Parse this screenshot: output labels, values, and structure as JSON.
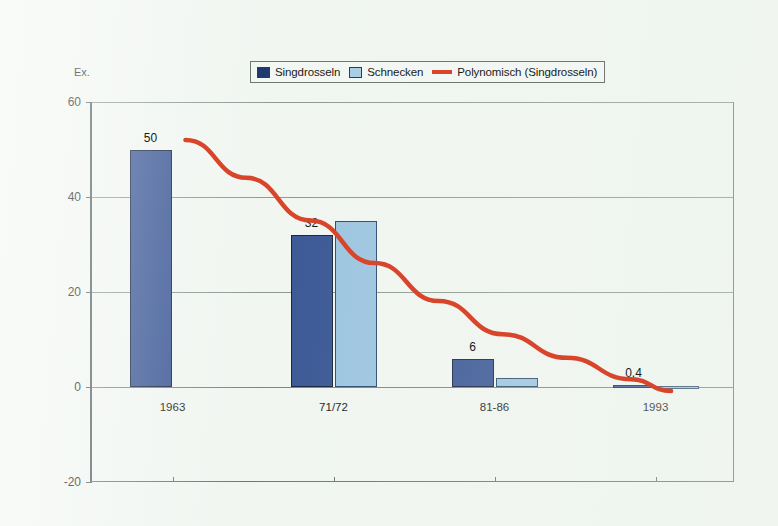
{
  "chart_data": {
    "type": "bar",
    "title": "",
    "subtitle": "",
    "xlabel": "",
    "ylabel": "Ex.",
    "categories": [
      "1963",
      "71/72",
      "81-86",
      "1993"
    ],
    "series": [
      {
        "name": "Singdrosseln",
        "color": "#3a5795",
        "values": [
          50,
          32,
          6,
          0.4
        ]
      },
      {
        "name": "Schnecken",
        "color": "#9cc5e0",
        "values": [
          0,
          35,
          2,
          0.3
        ]
      }
    ],
    "data_labels": [
      "50",
      "32",
      "6",
      "0,4"
    ],
    "trendline": {
      "name": "Polynomisch (Singdrosseln)",
      "color": "#d9452a",
      "type": "polynomial",
      "points": [
        {
          "x": 0.22,
          "y": 52
        },
        {
          "x": 0.6,
          "y": 44
        },
        {
          "x": 1.0,
          "y": 35
        },
        {
          "x": 1.4,
          "y": 26
        },
        {
          "x": 1.8,
          "y": 18
        },
        {
          "x": 2.2,
          "y": 11
        },
        {
          "x": 2.6,
          "y": 6
        },
        {
          "x": 3.0,
          "y": 1.5
        },
        {
          "x": 3.25,
          "y": -1
        }
      ]
    },
    "ylim": [
      -20,
      60
    ],
    "y_ticks": [
      60,
      40,
      20,
      0,
      -20
    ],
    "grid": true,
    "legend_position": "top-center"
  },
  "legend": {
    "items": [
      {
        "label": "Singdrosseln",
        "marker": "square",
        "color": "#3a5795"
      },
      {
        "label": "Schnecken",
        "marker": "square",
        "color": "#9cc5e0"
      },
      {
        "label": "Polynomisch (Singdrosseln)",
        "marker": "line",
        "color": "#d9452a"
      }
    ]
  },
  "axes": {
    "y_unit": "Ex.",
    "y_tick_labels": [
      "60",
      "40",
      "20",
      "0",
      "-20"
    ],
    "x_tick_labels": [
      "1963",
      "71/72",
      "81-86",
      "1993"
    ]
  }
}
